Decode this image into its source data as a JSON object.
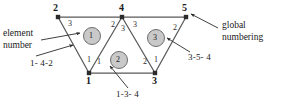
{
  "figure": {
    "colors": {
      "line": "#595959",
      "node": "#2b2b2b",
      "element_circle_fill": "#c9c9c9",
      "element_circle_stroke": "#6e6e6e",
      "text": "#1a1a1a",
      "background": "#ffffff"
    }
  },
  "global_nodes": [
    {
      "id": "n2",
      "label": "2",
      "x": 58,
      "y": 17
    },
    {
      "id": "n4",
      "label": "4",
      "x": 122,
      "y": 17
    },
    {
      "id": "n5",
      "label": "5",
      "x": 186,
      "y": 17
    },
    {
      "id": "n1",
      "label": "1",
      "x": 89,
      "y": 73
    },
    {
      "id": "n3",
      "label": "3",
      "x": 155,
      "y": 73
    }
  ],
  "elements": [
    {
      "id": "e1",
      "label": "1",
      "cx": 92,
      "cy": 36,
      "connectivity": "1- 4-2"
    },
    {
      "id": "e2",
      "label": "2",
      "cx": 119,
      "cy": 60,
      "connectivity": "1-3- 4"
    },
    {
      "id": "e3",
      "label": "3",
      "cx": 156,
      "cy": 38,
      "connectivity": "3-5- 4"
    }
  ],
  "local_numbers": [
    {
      "id": "L1",
      "label": "3",
      "x": 68,
      "y": 24,
      "element": "1",
      "at_global_node": "2"
    },
    {
      "id": "L2",
      "label": "1",
      "x": 87,
      "y": 60,
      "element": "1",
      "at_global_node": "1"
    },
    {
      "id": "L3",
      "label": "2",
      "x": 112,
      "y": 25,
      "element": "1",
      "at_global_node": "4"
    },
    {
      "id": "L4",
      "label": "1",
      "x": 97,
      "y": 62,
      "element": "2",
      "at_global_node": "1"
    },
    {
      "id": "L5",
      "label": "3",
      "x": 122,
      "y": 29,
      "element": "2",
      "at_global_node": "4"
    },
    {
      "id": "L6",
      "label": "2",
      "x": 143,
      "y": 62,
      "element": "2",
      "at_global_node": "3"
    },
    {
      "id": "L7",
      "label": "3",
      "x": 133,
      "y": 25,
      "element": "3",
      "at_global_node": "4"
    },
    {
      "id": "L8",
      "label": "2",
      "x": 174,
      "y": 28,
      "element": "3",
      "at_global_node": "5"
    },
    {
      "id": "L9",
      "label": "1",
      "x": 155,
      "y": 60,
      "element": "3",
      "at_global_node": "3"
    }
  ],
  "annotations": {
    "element_number": {
      "line1": "element",
      "line2": "number",
      "x": 3,
      "y": 31
    },
    "global_numbering": {
      "line1": "global",
      "line2": "numbering",
      "x": 222,
      "y": 22
    },
    "conn_e1": {
      "text": "1- 4-2",
      "x": 30,
      "y": 63
    },
    "conn_e2": {
      "text": "1-3- 4",
      "x": 116,
      "y": 93
    },
    "conn_e3": {
      "text": "3-5- 4",
      "x": 188,
      "y": 56
    }
  }
}
